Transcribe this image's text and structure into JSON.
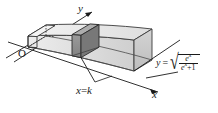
{
  "figure": {
    "background": "#ffffff",
    "ink": "#1a1a1a",
    "size": {
      "width": 218,
      "height": 113
    }
  },
  "axes": {
    "origin_label": "O",
    "x_label": "x",
    "y_label": "y",
    "z_implied": true
  },
  "labels": {
    "slab_plane": {
      "var": "x",
      "eq": "=",
      "value": "k",
      "full": "x=k"
    },
    "curve": {
      "lhs": "y",
      "eq": "=",
      "radical": "√",
      "numerator": "e",
      "numerator_exp": "x",
      "denominator_base": "e",
      "denominator_exp": "x",
      "denominator_plus": "+1",
      "full": "y = √(e^x/(e^x+1))"
    }
  },
  "shading": {
    "top_face": "#e9e9e9",
    "front_face": "#dcdcdc",
    "right_face": "#c9c9c9",
    "slab_front": "#8a8a8a",
    "slab_side": "#6f6f6f",
    "slab_top": "#a8a8a8",
    "hidden_edge_style": "dashed"
  }
}
